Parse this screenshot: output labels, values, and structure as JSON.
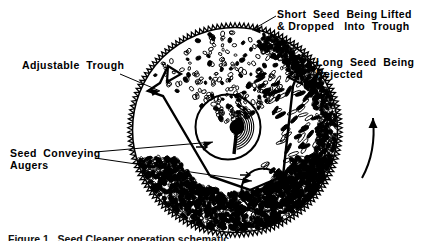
{
  "figure": {
    "title_caption": "Figure 1.  Seed Cleaner operation schematic.",
    "labels": {
      "adjustable_trough": "Adjustable  Trough",
      "seed_conveying_augers_line1": "Seed  Conveying",
      "seed_conveying_augers_line2": "Augers",
      "short_seed_line1": "Short  Seed  Being Lifted",
      "short_seed_line2": "& Dropped   Into  Trough",
      "long_seed_line1": "Long  Seed  Being",
      "long_seed_line2": "Rejected"
    },
    "colors": {
      "ink": "#000000",
      "background": "#ffffff"
    },
    "geometry": {
      "disc_center_x": 235,
      "disc_center_y": 130,
      "disc_radius": 104,
      "disc_rim_teeth": 150,
      "upper_auger_center_x": 228,
      "upper_auger_center_y": 127,
      "upper_auger_radius": 33,
      "lower_auger_center_x": 263,
      "lower_auger_center_y": 190,
      "lower_auger_radius": 22,
      "rotation_direction": "counter-clockwise"
    },
    "icons": {
      "rotation_arrow": "curved-up-arrow-icon",
      "leader_arrow": "arrowhead-icon"
    }
  }
}
